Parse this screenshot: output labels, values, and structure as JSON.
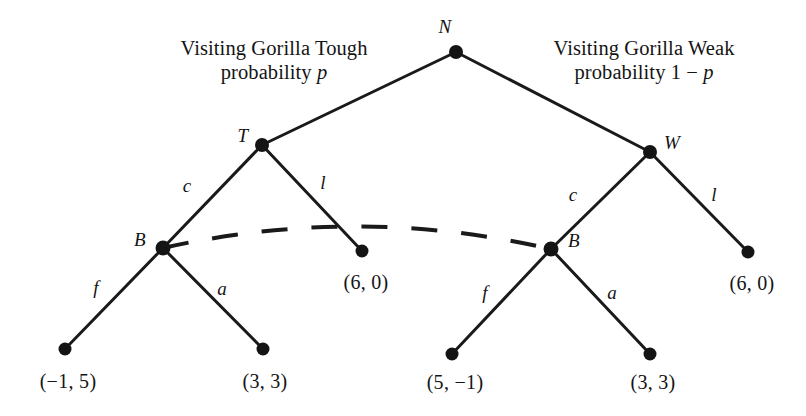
{
  "figure": {
    "type": "game-tree"
  },
  "annotations": [
    {
      "id": "tough",
      "line1": "Visiting Gorilla Tough",
      "line2_prefix": "probability ",
      "line2_italic": "p",
      "line2_suffix": "",
      "x": 274,
      "y": 60
    },
    {
      "id": "weak",
      "line1": "Visiting Gorilla Weak",
      "line2_prefix": "probability 1 − ",
      "line2_italic": "p",
      "line2_suffix": "",
      "x": 644,
      "y": 60
    }
  ],
  "nodes": [
    {
      "id": "N",
      "label": "N",
      "x": 456,
      "y": 52,
      "r": 7.0,
      "label_x": 445,
      "label_y": 27,
      "kind": "chance"
    },
    {
      "id": "T",
      "label": "T",
      "x": 262,
      "y": 145,
      "r": 7.0,
      "label_x": 243,
      "label_y": 136,
      "kind": "decision"
    },
    {
      "id": "W",
      "label": "W",
      "x": 650,
      "y": 152,
      "r": 7.0,
      "label_x": 672,
      "label_y": 143,
      "kind": "decision"
    },
    {
      "id": "BL",
      "label": "B",
      "x": 163,
      "y": 248,
      "r": 7.5,
      "label_x": 140,
      "label_y": 240,
      "kind": "decision"
    },
    {
      "id": "BR",
      "label": "B",
      "x": 551,
      "y": 249,
      "r": 7.5,
      "label_x": 574,
      "label_y": 241,
      "kind": "decision"
    },
    {
      "id": "t1",
      "label": "",
      "x": 65,
      "y": 349,
      "r": 6.5,
      "kind": "terminal"
    },
    {
      "id": "t2",
      "label": "",
      "x": 263,
      "y": 349,
      "r": 6.5,
      "kind": "terminal"
    },
    {
      "id": "t3",
      "label": "",
      "x": 362,
      "y": 251,
      "r": 6.5,
      "kind": "terminal"
    },
    {
      "id": "t4",
      "label": "",
      "x": 452,
      "y": 354,
      "r": 6.5,
      "kind": "terminal"
    },
    {
      "id": "t5",
      "label": "",
      "x": 650,
      "y": 354,
      "r": 6.5,
      "kind": "terminal"
    },
    {
      "id": "t6",
      "label": "",
      "x": 748,
      "y": 252,
      "r": 6.5,
      "kind": "terminal"
    }
  ],
  "edges": [
    {
      "from": "N",
      "to": "T",
      "label": "",
      "label_x": 0,
      "label_y": 0
    },
    {
      "from": "N",
      "to": "W",
      "label": "",
      "label_x": 0,
      "label_y": 0
    },
    {
      "from": "T",
      "to": "BL",
      "label": "c",
      "label_x": 187,
      "label_y": 186
    },
    {
      "from": "T",
      "to": "t3",
      "label": "l",
      "label_x": 323,
      "label_y": 183
    },
    {
      "from": "W",
      "to": "BR",
      "label": "c",
      "label_x": 573,
      "label_y": 195
    },
    {
      "from": "W",
      "to": "t6",
      "label": "l",
      "label_x": 714,
      "label_y": 195
    },
    {
      "from": "BL",
      "to": "t1",
      "label": "f",
      "label_x": 96,
      "label_y": 288
    },
    {
      "from": "BL",
      "to": "t2",
      "label": "a",
      "label_x": 222,
      "label_y": 289
    },
    {
      "from": "BR",
      "to": "t4",
      "label": "f",
      "label_x": 485,
      "label_y": 293
    },
    {
      "from": "BR",
      "to": "t5",
      "label": "a",
      "label_x": 612,
      "label_y": 293
    }
  ],
  "payoffs": [
    {
      "node": "t1",
      "text": "(−1, 5)",
      "x": 68,
      "y": 382
    },
    {
      "node": "t2",
      "text": "(3, 3)",
      "x": 265,
      "y": 382
    },
    {
      "node": "t3",
      "text": "(6, 0)",
      "x": 366,
      "y": 283
    },
    {
      "node": "t4",
      "text": "(5, −1)",
      "x": 455,
      "y": 383
    },
    {
      "node": "t5",
      "text": "(3, 3)",
      "x": 653,
      "y": 383
    },
    {
      "node": "t6",
      "text": "(6, 0)",
      "x": 752,
      "y": 284
    }
  ],
  "information_set": {
    "connects": [
      "BL",
      "BR"
    ],
    "style": "dashed-arc",
    "dash_pattern": "26 24"
  },
  "style": {
    "line_color": "#1a1a1a",
    "node_fill": "#141414",
    "background": "#ffffff",
    "edge_width": 3.0,
    "dash_width": 4.0
  },
  "chart_data": {
    "type": "tree",
    "title": "",
    "nodes": [
      "N",
      "T",
      "W",
      "B (left)",
      "B (right)"
    ],
    "terminal_payoffs": [
      {
        "path": "T,c,f",
        "value": [
          -1,
          5
        ]
      },
      {
        "path": "T,c,a",
        "value": [
          3,
          3
        ]
      },
      {
        "path": "T,l",
        "value": [
          6,
          0
        ]
      },
      {
        "path": "W,c,f",
        "value": [
          5,
          -1
        ]
      },
      {
        "path": "W,c,a",
        "value": [
          3,
          3
        ]
      },
      {
        "path": "W,l",
        "value": [
          6,
          0
        ]
      }
    ],
    "chance_probabilities": [
      {
        "branch": "Tough",
        "probability": "p"
      },
      {
        "branch": "Weak",
        "probability": "1 - p"
      }
    ]
  }
}
